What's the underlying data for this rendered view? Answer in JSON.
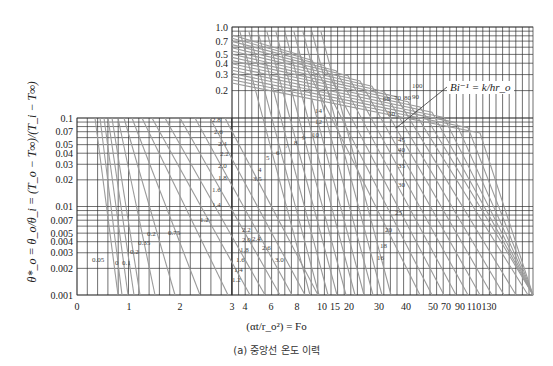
{
  "chart_data": {
    "type": "line",
    "caption": "(a) 중앙선 온도 이력",
    "xlabel": "(αt/r_o²) = Fo",
    "ylabel": "θ*_o = θ_o/θ_i = (T_o − T∞)/(T_i − T∞)",
    "yscale": "log",
    "ylim": [
      0.001,
      1.0
    ],
    "grid": true,
    "parameter_label": "Bi⁻¹ = k/hr_o",
    "x_ticks": [
      "0",
      "1",
      "2",
      "3",
      "4",
      "6",
      "8",
      "10",
      "15",
      "20",
      "30",
      "40",
      "50",
      "70",
      "90",
      "110",
      "130"
    ],
    "y_ticks_upper": [
      "1.0",
      "0.7",
      "0.5",
      "0.4",
      "0.3",
      "0.2"
    ],
    "y_ticks_lower": [
      "0.1",
      "0.07",
      "0.05",
      "0.04",
      "0.03",
      "0.02",
      "0.01",
      "0.007",
      "0.005",
      "0.004",
      "0.003",
      "0.002",
      "0.001"
    ],
    "series_labels_lower_left": [
      "0",
      "0.05",
      "0.1",
      "0.2",
      "0.35",
      "0.2",
      "0.75",
      "1.2",
      "1.4",
      "1.6",
      "1.8",
      "2.0",
      "2.2",
      "2.4",
      "2.6",
      "2.8"
    ],
    "series_labels_middle": [
      "1.2",
      "1.4",
      "1.6",
      "1.8",
      "2.0",
      "2.2",
      "2.4",
      "2.6",
      "3.0",
      "3.5",
      "4",
      "5",
      "6",
      "7",
      "8",
      "9",
      "10",
      "12",
      "14"
    ],
    "series_labels_right": [
      "16",
      "18",
      "20",
      "25",
      "30",
      "35",
      "40",
      "45",
      "50",
      "60",
      "70",
      "80",
      "90",
      "100"
    ],
    "series": [
      {
        "name": "Bi⁻¹=0",
        "values": [
          [
            0,
            1.0
          ],
          [
            0.6,
            0.002
          ]
        ]
      },
      {
        "name": "Bi⁻¹=0.1",
        "values": [
          [
            0,
            1.0
          ],
          [
            0.75,
            0.002
          ]
        ]
      },
      {
        "name": "Bi⁻¹=0.35",
        "values": [
          [
            0,
            1.0
          ],
          [
            1.0,
            0.003
          ]
        ]
      },
      {
        "name": "Bi⁻¹=0.75",
        "values": [
          [
            0,
            1.0
          ],
          [
            1.6,
            0.005
          ]
        ]
      },
      {
        "name": "Bi⁻¹=1.2",
        "values": [
          [
            0,
            1.0
          ],
          [
            2.2,
            0.007
          ]
        ]
      },
      {
        "name": "Bi⁻¹=2.0",
        "values": [
          [
            0,
            1.0
          ],
          [
            3.0,
            0.002
          ]
        ]
      },
      {
        "name": "Bi⁻¹=3.0",
        "values": [
          [
            0,
            1.0
          ],
          [
            6,
            0.003
          ]
        ]
      },
      {
        "name": "Bi⁻¹=5",
        "values": [
          [
            0,
            1.0
          ],
          [
            10,
            0.005
          ]
        ]
      },
      {
        "name": "Bi⁻¹=10",
        "values": [
          [
            0,
            1.0
          ],
          [
            20,
            0.005
          ]
        ]
      },
      {
        "name": "Bi⁻¹=20",
        "values": [
          [
            0,
            1.0
          ],
          [
            40,
            0.003
          ]
        ]
      },
      {
        "name": "Bi⁻¹=50",
        "values": [
          [
            0,
            1.0
          ],
          [
            90,
            0.004
          ]
        ]
      },
      {
        "name": "Bi⁻¹=100",
        "values": [
          [
            0,
            1.0
          ],
          [
            130,
            0.02
          ]
        ]
      }
    ]
  }
}
